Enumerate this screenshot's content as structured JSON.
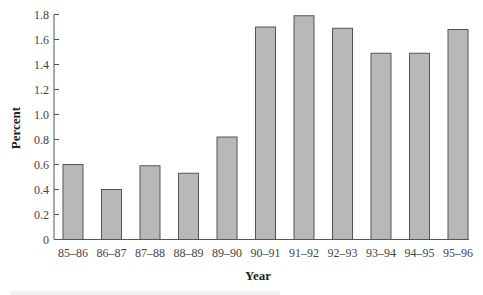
{
  "chart_data": {
    "type": "bar",
    "title": "",
    "xlabel": "Year",
    "ylabel": "Percent",
    "categories": [
      "85–86",
      "86–87",
      "87–88",
      "88–89",
      "89–90",
      "90–91",
      "91–92",
      "92–93",
      "93–94",
      "94–95",
      "95–96"
    ],
    "values": [
      0.6,
      0.4,
      0.59,
      0.53,
      0.82,
      1.7,
      1.79,
      1.69,
      1.49,
      1.49,
      1.68
    ],
    "ylim": [
      0,
      1.8
    ],
    "yticks": [
      "0",
      "0.2",
      "0.4",
      "0.6",
      "0.8",
      "1.0",
      "1.2",
      "1.4",
      "1.6",
      "1.8"
    ],
    "grid": false,
    "legend": null,
    "bar_color": "#b8b8b8",
    "bar_edge_color": "#555555"
  },
  "labels": {
    "ylabel": "Percent",
    "xlabel": "Year"
  }
}
